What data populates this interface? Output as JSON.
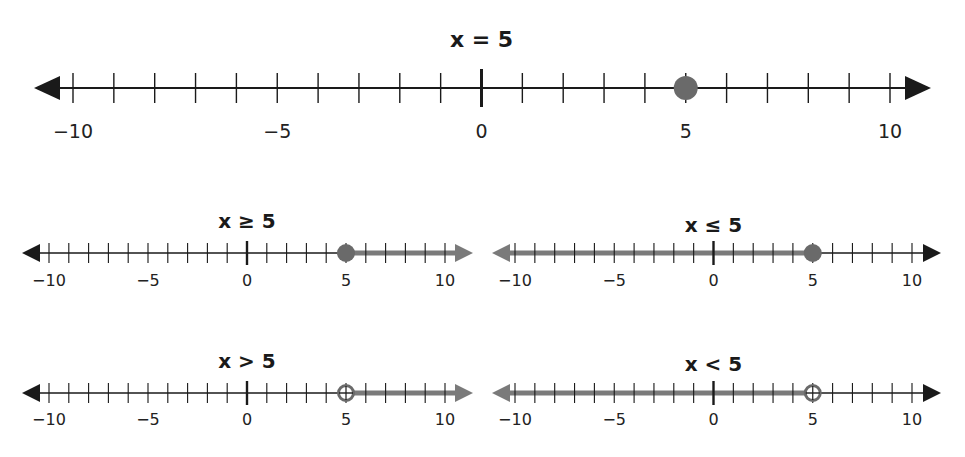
{
  "colors": {
    "line": "#1a1a1a",
    "shade": "#7a7a7a",
    "dot": "#6a6a6a"
  },
  "chart_data": [
    {
      "type": "number_line",
      "title": "x = 5",
      "range": [
        -10,
        10
      ],
      "tick_step": 1,
      "labels": [
        "−10",
        "−5",
        "0",
        "5",
        "10"
      ],
      "point": 5,
      "point_type": "closed",
      "shade": "none"
    },
    {
      "type": "number_line",
      "title": "x ≥ 5",
      "range": [
        -10,
        10
      ],
      "tick_step": 1,
      "labels": [
        "−10",
        "−5",
        "0",
        "5",
        "10"
      ],
      "point": 5,
      "point_type": "closed",
      "shade": "right"
    },
    {
      "type": "number_line",
      "title": "x ≤ 5",
      "range": [
        -10,
        10
      ],
      "tick_step": 1,
      "labels": [
        "−10",
        "−5",
        "0",
        "5",
        "10"
      ],
      "point": 5,
      "point_type": "closed",
      "shade": "left"
    },
    {
      "type": "number_line",
      "title": "x > 5",
      "range": [
        -10,
        10
      ],
      "tick_step": 1,
      "labels": [
        "−10",
        "−5",
        "0",
        "5",
        "10"
      ],
      "point": 5,
      "point_type": "open",
      "shade": "right"
    },
    {
      "type": "number_line",
      "title": "x < 5",
      "range": [
        -10,
        10
      ],
      "tick_step": 1,
      "labels": [
        "−10",
        "−5",
        "0",
        "5",
        "10"
      ],
      "point": 5,
      "point_type": "open",
      "shade": "left"
    }
  ]
}
